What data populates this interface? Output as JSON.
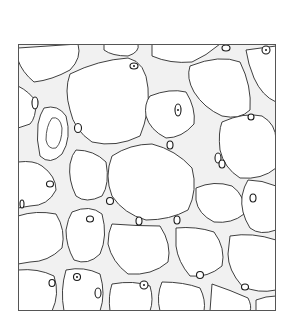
{
  "figure": {
    "style": "black line drawing",
    "colors": {
      "background": "#ffffff",
      "line": "#2a2a2a",
      "wall_fill": "#f1f1f1",
      "border": "#555555"
    },
    "frame": {
      "x": 18,
      "y": 44,
      "width": 258,
      "height": 267
    }
  }
}
